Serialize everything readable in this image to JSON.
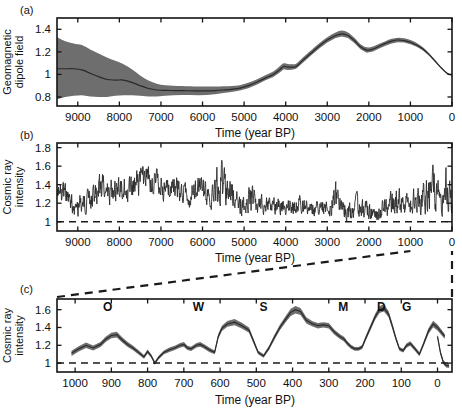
{
  "figure": {
    "panels": [
      {
        "id": "a",
        "label": "(a)",
        "ylabel": "Geomagnetic\ndipole field",
        "ylabel_line1": "Geomagnetic",
        "ylabel_line2": "dipole field",
        "xlabel": "Time (year BP)"
      },
      {
        "id": "b",
        "label": "(b)",
        "ylabel_line1": "Cosmic ray",
        "ylabel_line2": "intensity",
        "xlabel": "Time (year BP)"
      },
      {
        "id": "c",
        "label": "(c)",
        "ylabel_line1": "Cosmic ray",
        "ylabel_line2": "intensity",
        "xlabel": "Time (year BP)"
      }
    ],
    "colors": {
      "band": "#6e6e6e",
      "line": "#2b2b2b",
      "axis": "#141414",
      "background": "#ffffff"
    }
  },
  "chart_data": [
    {
      "panel": "a",
      "type": "area",
      "title": "",
      "xlabel": "Time (year BP)",
      "ylabel": "Geomagnetic dipole field",
      "xlim": [
        9500,
        0
      ],
      "ylim": [
        0.72,
        1.5
      ],
      "x_reversed": true,
      "grid": false,
      "legend": null,
      "xticks": [
        9000,
        8000,
        7000,
        6000,
        5000,
        4000,
        3000,
        2000,
        1000,
        0
      ],
      "xticklabels": [
        "9000",
        "8000",
        "7000",
        "6000",
        "5000",
        "4000",
        "3000",
        "2000",
        "1000",
        "0"
      ],
      "yticks": [
        0.8,
        1,
        1.2,
        1.4
      ],
      "yticklabels": [
        "0.8",
        "1",
        "1.2",
        "1.4"
      ],
      "x": [
        9500,
        9300,
        9100,
        8900,
        8700,
        8500,
        8300,
        8100,
        7900,
        7700,
        7500,
        7300,
        7100,
        6900,
        6700,
        6500,
        6300,
        6100,
        5900,
        5700,
        5500,
        5300,
        5100,
        4900,
        4700,
        4500,
        4300,
        4150,
        4050,
        3950,
        3850,
        3750,
        3600,
        3400,
        3200,
        3000,
        2800,
        2650,
        2500,
        2350,
        2200,
        2050,
        1900,
        1750,
        1600,
        1450,
        1300,
        1150,
        1000,
        850,
        700,
        550,
        400,
        250,
        100,
        0
      ],
      "mean": [
        1.05,
        1.05,
        1.05,
        1.04,
        1.01,
        0.98,
        0.955,
        0.95,
        0.95,
        0.93,
        0.9,
        0.875,
        0.862,
        0.858,
        0.857,
        0.856,
        0.855,
        0.854,
        0.854,
        0.857,
        0.862,
        0.868,
        0.878,
        0.9,
        0.93,
        0.965,
        1.0,
        1.04,
        1.07,
        1.065,
        1.065,
        1.07,
        1.12,
        1.185,
        1.25,
        1.305,
        1.345,
        1.36,
        1.345,
        1.3,
        1.245,
        1.215,
        1.225,
        1.25,
        1.275,
        1.295,
        1.305,
        1.3,
        1.285,
        1.26,
        1.225,
        1.175,
        1.115,
        1.055,
        1.005,
        0.995
      ],
      "lower": [
        0.78,
        0.8,
        0.81,
        0.815,
        0.805,
        0.8,
        0.8,
        0.81,
        0.815,
        0.815,
        0.81,
        0.805,
        0.805,
        0.81,
        0.815,
        0.818,
        0.818,
        0.815,
        0.818,
        0.825,
        0.835,
        0.845,
        0.858,
        0.878,
        0.908,
        0.945,
        0.978,
        1.015,
        1.045,
        1.04,
        1.042,
        1.05,
        1.1,
        1.165,
        1.228,
        1.283,
        1.322,
        1.335,
        1.322,
        1.278,
        1.222,
        1.192,
        1.203,
        1.23,
        1.255,
        1.275,
        1.285,
        1.282,
        1.268,
        1.245,
        1.212,
        1.165,
        1.105,
        1.048,
        1.0,
        0.99
      ],
      "upper": [
        1.33,
        1.295,
        1.275,
        1.26,
        1.22,
        1.185,
        1.15,
        1.12,
        1.09,
        1.045,
        0.99,
        0.945,
        0.918,
        0.905,
        0.9,
        0.898,
        0.895,
        0.893,
        0.892,
        0.893,
        0.895,
        0.898,
        0.905,
        0.925,
        0.955,
        0.99,
        1.025,
        1.07,
        1.098,
        1.092,
        1.09,
        1.095,
        1.145,
        1.21,
        1.275,
        1.33,
        1.372,
        1.39,
        1.372,
        1.325,
        1.268,
        1.24,
        1.248,
        1.272,
        1.295,
        1.315,
        1.325,
        1.32,
        1.305,
        1.278,
        1.24,
        1.188,
        1.125,
        1.062,
        1.01,
        1.0
      ],
      "notes": "Geomagnetic dipole field strength, normalized; shaded band = uncertainty envelope"
    },
    {
      "panel": "b",
      "type": "line",
      "title": "",
      "xlabel": "Time (year BP)",
      "ylabel": "Cosmic ray intensity",
      "xlim": [
        9500,
        0
      ],
      "ylim": [
        0.9,
        1.85
      ],
      "x_reversed": true,
      "grid": false,
      "legend": null,
      "reference_line": {
        "y": 1,
        "style": "dashed"
      },
      "xticks": [
        9000,
        8000,
        7000,
        6000,
        5000,
        4000,
        3000,
        2000,
        1000,
        0
      ],
      "xticklabels": [
        "9000",
        "8000",
        "7000",
        "6000",
        "5000",
        "4000",
        "3000",
        "2000",
        "1000",
        "0"
      ],
      "yticks": [
        1,
        1.2,
        1.4,
        1.6,
        1.8
      ],
      "yticklabels": [
        "1",
        "1.2",
        "1.4",
        "1.6",
        "1.8"
      ],
      "seed": 20240607,
      "envelope": [
        {
          "x": 9500,
          "base": 1.27,
          "amp": 0.1
        },
        {
          "x": 9350,
          "base": 1.32,
          "amp": 0.11
        },
        {
          "x": 9200,
          "base": 1.25,
          "amp": 0.12
        },
        {
          "x": 9050,
          "base": 1.14,
          "amp": 0.1
        },
        {
          "x": 8900,
          "base": 1.2,
          "amp": 0.11
        },
        {
          "x": 8750,
          "base": 1.24,
          "amp": 0.12
        },
        {
          "x": 8600,
          "base": 1.27,
          "amp": 0.13
        },
        {
          "x": 8450,
          "base": 1.38,
          "amp": 0.18
        },
        {
          "x": 8300,
          "base": 1.3,
          "amp": 0.13
        },
        {
          "x": 8150,
          "base": 1.33,
          "amp": 0.13
        },
        {
          "x": 8000,
          "base": 1.32,
          "amp": 0.13
        },
        {
          "x": 7850,
          "base": 1.36,
          "amp": 0.12
        },
        {
          "x": 7700,
          "base": 1.34,
          "amp": 0.12
        },
        {
          "x": 7550,
          "base": 1.42,
          "amp": 0.16
        },
        {
          "x": 7400,
          "base": 1.45,
          "amp": 0.15
        },
        {
          "x": 7250,
          "base": 1.47,
          "amp": 0.16
        },
        {
          "x": 7100,
          "base": 1.41,
          "amp": 0.14
        },
        {
          "x": 6950,
          "base": 1.35,
          "amp": 0.13
        },
        {
          "x": 6800,
          "base": 1.33,
          "amp": 0.13
        },
        {
          "x": 6650,
          "base": 1.38,
          "amp": 0.14
        },
        {
          "x": 6500,
          "base": 1.33,
          "amp": 0.13
        },
        {
          "x": 6350,
          "base": 1.3,
          "amp": 0.13
        },
        {
          "x": 6200,
          "base": 1.3,
          "amp": 0.13
        },
        {
          "x": 6050,
          "base": 1.36,
          "amp": 0.14
        },
        {
          "x": 5900,
          "base": 1.3,
          "amp": 0.13
        },
        {
          "x": 5750,
          "base": 1.28,
          "amp": 0.13
        },
        {
          "x": 5600,
          "base": 1.44,
          "amp": 0.26
        },
        {
          "x": 5450,
          "base": 1.35,
          "amp": 0.17
        },
        {
          "x": 5300,
          "base": 1.33,
          "amp": 0.16
        },
        {
          "x": 5150,
          "base": 1.2,
          "amp": 0.12
        },
        {
          "x": 5000,
          "base": 1.16,
          "amp": 0.1
        },
        {
          "x": 4850,
          "base": 1.28,
          "amp": 0.16
        },
        {
          "x": 4700,
          "base": 1.18,
          "amp": 0.1
        },
        {
          "x": 4550,
          "base": 1.19,
          "amp": 0.1
        },
        {
          "x": 4400,
          "base": 1.18,
          "amp": 0.09
        },
        {
          "x": 4250,
          "base": 1.19,
          "amp": 0.09
        },
        {
          "x": 4100,
          "base": 1.18,
          "amp": 0.09
        },
        {
          "x": 3950,
          "base": 1.18,
          "amp": 0.09
        },
        {
          "x": 3800,
          "base": 1.19,
          "amp": 0.09
        },
        {
          "x": 3650,
          "base": 1.21,
          "amp": 0.1
        },
        {
          "x": 3500,
          "base": 1.17,
          "amp": 0.09
        },
        {
          "x": 3350,
          "base": 1.15,
          "amp": 0.09
        },
        {
          "x": 3200,
          "base": 1.14,
          "amp": 0.08
        },
        {
          "x": 3050,
          "base": 1.14,
          "amp": 0.09
        },
        {
          "x": 2900,
          "base": 1.16,
          "amp": 0.1
        },
        {
          "x": 2800,
          "base": 1.28,
          "amp": 0.16
        },
        {
          "x": 2700,
          "base": 1.18,
          "amp": 0.11
        },
        {
          "x": 2550,
          "base": 1.12,
          "amp": 0.09
        },
        {
          "x": 2400,
          "base": 1.1,
          "amp": 0.1
        },
        {
          "x": 2250,
          "base": 1.18,
          "amp": 0.13
        },
        {
          "x": 2100,
          "base": 1.13,
          "amp": 0.1
        },
        {
          "x": 1950,
          "base": 1.12,
          "amp": 0.1
        },
        {
          "x": 1800,
          "base": 1.1,
          "amp": 0.09
        },
        {
          "x": 1650,
          "base": 1.14,
          "amp": 0.1
        },
        {
          "x": 1500,
          "base": 1.18,
          "amp": 0.11
        },
        {
          "x": 1350,
          "base": 1.26,
          "amp": 0.16
        },
        {
          "x": 1200,
          "base": 1.18,
          "amp": 0.11
        },
        {
          "x": 1050,
          "base": 1.19,
          "amp": 0.12
        },
        {
          "x": 900,
          "base": 1.25,
          "amp": 0.14
        },
        {
          "x": 750,
          "base": 1.22,
          "amp": 0.13
        },
        {
          "x": 600,
          "base": 1.32,
          "amp": 0.2
        },
        {
          "x": 450,
          "base": 1.38,
          "amp": 0.22
        },
        {
          "x": 300,
          "base": 1.3,
          "amp": 0.2
        },
        {
          "x": 150,
          "base": 1.36,
          "amp": 0.22
        },
        {
          "x": 0,
          "base": 1.2,
          "amp": 0.14
        }
      ],
      "notes": "High-resolution cosmic ray intensity record, normalized to 1"
    },
    {
      "panel": "c",
      "type": "area",
      "title": "",
      "xlabel": "Time (year BP)",
      "ylabel": "Cosmic ray intensity",
      "xlim": [
        1050,
        -40
      ],
      "ylim": [
        0.9,
        1.72
      ],
      "x_reversed": true,
      "grid": false,
      "legend": null,
      "reference_line": {
        "y": 1,
        "style": "dashed"
      },
      "xticks": [
        1000,
        900,
        800,
        700,
        600,
        500,
        400,
        300,
        200,
        100,
        0
      ],
      "xticklabels": [
        "1000",
        "900",
        "800",
        "700",
        "600",
        "500",
        "400",
        "300",
        "200",
        "100",
        "0"
      ],
      "yticks": [
        1,
        1.2,
        1.4,
        1.6
      ],
      "yticklabels": [
        "1",
        "1.2",
        "1.4",
        "1.6"
      ],
      "event_labels": [
        {
          "symbol": "O",
          "x": 910,
          "name": "Oort minimum"
        },
        {
          "symbol": "W",
          "x": 660,
          "name": "Wolf minimum"
        },
        {
          "symbol": "S",
          "x": 480,
          "name": "Spoerer minimum"
        },
        {
          "symbol": "M",
          "x": 260,
          "name": "Maunder minimum"
        },
        {
          "symbol": "D",
          "x": 155,
          "name": "Dalton minimum"
        },
        {
          "symbol": "G",
          "x": 85,
          "name": "Gleissberg minimum"
        }
      ],
      "x": [
        1010,
        990,
        970,
        950,
        930,
        915,
        900,
        885,
        870,
        855,
        840,
        825,
        810,
        800,
        790,
        780,
        770,
        755,
        740,
        725,
        710,
        700,
        690,
        680,
        665,
        655,
        645,
        630,
        615,
        605,
        595,
        580,
        560,
        540,
        520,
        508,
        495,
        480,
        465,
        450,
        435,
        418,
        405,
        392,
        378,
        362,
        345,
        330,
        315,
        300,
        285,
        270,
        258,
        248,
        238,
        228,
        218,
        208,
        198,
        185,
        172,
        160,
        148,
        135,
        125,
        115,
        105,
        95,
        85,
        75,
        62,
        50,
        38,
        25,
        12,
        0,
        -20
      ],
      "mean": [
        1.11,
        1.16,
        1.2,
        1.17,
        1.21,
        1.27,
        1.31,
        1.32,
        1.26,
        1.21,
        1.17,
        1.12,
        1.07,
        1.13,
        1.08,
        1.0,
        1.06,
        1.12,
        1.15,
        1.17,
        1.2,
        1.21,
        1.17,
        1.16,
        1.2,
        1.21,
        1.19,
        1.15,
        1.12,
        1.3,
        1.39,
        1.44,
        1.46,
        1.42,
        1.37,
        1.25,
        1.12,
        1.08,
        1.17,
        1.29,
        1.4,
        1.5,
        1.57,
        1.6,
        1.58,
        1.48,
        1.44,
        1.42,
        1.43,
        1.42,
        1.35,
        1.3,
        1.27,
        1.22,
        1.18,
        1.16,
        1.16,
        1.18,
        1.28,
        1.4,
        1.52,
        1.6,
        1.62,
        1.55,
        1.42,
        1.28,
        1.16,
        1.14,
        1.2,
        1.22,
        1.16,
        1.1,
        1.22,
        1.36,
        1.44,
        1.4,
        1.3
      ],
      "halfwidth": [
        0.03,
        0.03,
        0.03,
        0.028,
        0.028,
        0.03,
        0.032,
        0.032,
        0.03,
        0.028,
        0.026,
        0.024,
        0.022,
        0.022,
        0.02,
        0.018,
        0.02,
        0.022,
        0.024,
        0.024,
        0.025,
        0.026,
        0.024,
        0.024,
        0.026,
        0.026,
        0.025,
        0.024,
        0.022,
        0.028,
        0.03,
        0.032,
        0.034,
        0.032,
        0.03,
        0.026,
        0.022,
        0.02,
        0.024,
        0.028,
        0.032,
        0.036,
        0.04,
        0.042,
        0.04,
        0.034,
        0.03,
        0.03,
        0.03,
        0.03,
        0.028,
        0.026,
        0.026,
        0.024,
        0.022,
        0.022,
        0.022,
        0.022,
        0.026,
        0.03,
        0.034,
        0.038,
        0.04,
        0.036,
        0.032,
        0.028,
        0.022,
        0.022,
        0.024,
        0.026,
        0.024,
        0.022,
        0.026,
        0.032,
        0.036,
        0.034,
        0.028
      ],
      "tail_x": [
        0,
        -8,
        -16,
        -24,
        -32
      ],
      "tail_mean": [
        1.3,
        1.12,
        1.01,
        0.975,
        0.97
      ],
      "notes": "Last millennium cosmic ray intensity with grand solar minima labelled O, W, S, M, D, G"
    }
  ],
  "connectors": {
    "upper_left_from_b_x": 1000,
    "upper_right_from_b_x": 0,
    "description": "dashed guide lines expanding panel b 1000-0 BP interval into panel c"
  }
}
